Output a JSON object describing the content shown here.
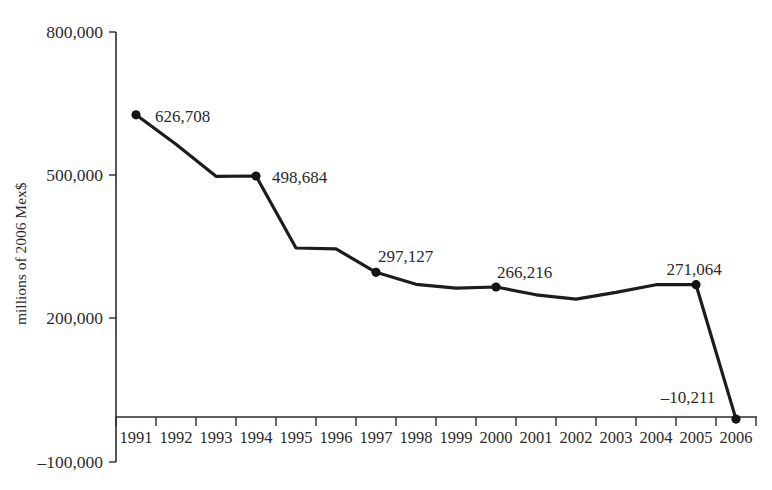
{
  "chart_data": {
    "type": "line",
    "title": "",
    "xlabel": "",
    "ylabel": "millions of 2006 Mex$",
    "ylim": [
      -100000,
      800000
    ],
    "ytick_labels": [
      "800,000",
      "500,000",
      "200,000",
      "–100,000"
    ],
    "ytick_values": [
      800000,
      500000,
      200000,
      -100000
    ],
    "grid": false,
    "legend": false,
    "categories": [
      "1991",
      "1992",
      "1993",
      "1994",
      "1995",
      "1996",
      "1997",
      "1998",
      "1999",
      "2000",
      "2001",
      "2002",
      "2003",
      "2004",
      "2005",
      "2006"
    ],
    "values": [
      626708,
      565000,
      498000,
      498684,
      348000,
      346000,
      297127,
      272000,
      264000,
      266216,
      250000,
      241000,
      255000,
      271000,
      271064,
      -10211
    ],
    "marked_points": [
      {
        "year": "1991",
        "value": 626708,
        "label": "626,708"
      },
      {
        "year": "1994",
        "value": 498684,
        "label": "498,684"
      },
      {
        "year": "1997",
        "value": 297127,
        "label": "297,127"
      },
      {
        "year": "2000",
        "value": 266216,
        "label": "266,216"
      },
      {
        "year": "2005",
        "value": 271064,
        "label": "271,064"
      },
      {
        "year": "2006",
        "value": -10211,
        "label": "–10,211"
      }
    ],
    "colors": {
      "line": "#1c1c1c",
      "marker": "#141414",
      "axis": "#2b2b2b",
      "text": "#2a2a2a",
      "background": "#ffffff"
    }
  },
  "axis": {
    "y_tick_0": "800,000",
    "y_tick_1": "500,000",
    "y_tick_2": "200,000",
    "y_tick_3": "–100,000",
    "y_axis_title": "millions of 2006 Mex$"
  },
  "x_years": {
    "y0": "1991",
    "y1": "1992",
    "y2": "1993",
    "y3": "1994",
    "y4": "1995",
    "y5": "1996",
    "y6": "1997",
    "y7": "1998",
    "y8": "1999",
    "y9": "2000",
    "y10": "2001",
    "y11": "2002",
    "y12": "2003",
    "y13": "2004",
    "y14": "2005",
    "y15": "2006"
  },
  "value_labels": {
    "v1991": "626,708",
    "v1994": "498,684",
    "v1997": "297,127",
    "v2000": "266,216",
    "v2005": "271,064",
    "v2006": "–10,211"
  }
}
